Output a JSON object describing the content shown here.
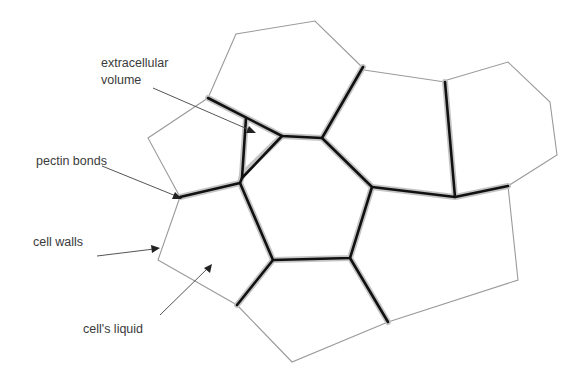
{
  "figure": {
    "type": "plant tissue cell diagram",
    "colors": {
      "background": "#ffffff",
      "thin_wall": "#9a9a9a",
      "bonded_wall": "#111111",
      "bond_halo": "#c4c4c4",
      "label_text": "#3a3a3a"
    }
  },
  "labels": {
    "extracellular": "extracellular",
    "volume": "volume",
    "pectin_bonds": "pectin bonds",
    "cell_walls": "cell walls",
    "cells_liquid": "cell's liquid"
  },
  "annotations": [
    {
      "label": "extracellular volume",
      "target": "triangular gap between three cells"
    },
    {
      "label": "pectin bonds",
      "target": "thick bonded wall segment"
    },
    {
      "label": "cell walls",
      "target": "thin cell boundary"
    },
    {
      "label": "cell's liquid",
      "target": "cell interior"
    }
  ]
}
